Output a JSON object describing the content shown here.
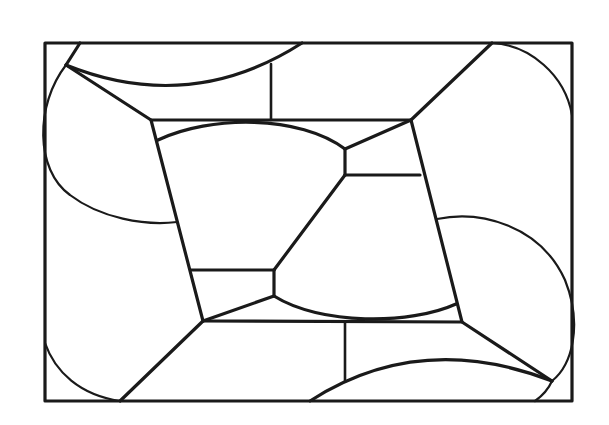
{
  "diagram": {
    "stroke_color": "#1a1a1a",
    "background_color": "#ffffff",
    "outer_frame": {
      "x1": 45,
      "y1": 43,
      "x2": 572,
      "y2": 401
    },
    "inner_parallelogram": {
      "top_left": [
        151,
        120
      ],
      "top_right": [
        411,
        120
      ],
      "bottom_right": [
        462,
        322
      ],
      "bottom_left": [
        203,
        321
      ]
    },
    "central_vertices": [
      [
        345,
        149
      ],
      [
        345,
        175
      ],
      [
        274,
        270
      ],
      [
        274,
        296
      ]
    ],
    "corner_vertices": [
      [
        66,
        65
      ],
      [
        492,
        43
      ],
      [
        552,
        381
      ],
      [
        120,
        401
      ]
    ]
  }
}
